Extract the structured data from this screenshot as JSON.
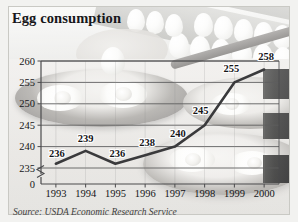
{
  "chart_data": {
    "type": "line",
    "title": "Egg consumption",
    "subtitle": "",
    "xlabel": "",
    "ylabel": "",
    "categories": [
      "1993",
      "1994",
      "1995",
      "1996",
      "1997",
      "1998",
      "1999",
      "2000"
    ],
    "values": [
      236,
      239,
      236,
      238,
      240,
      245,
      255,
      258
    ],
    "point_labels": [
      "236",
      "239",
      "236",
      "238",
      "240",
      "245",
      "255",
      "258"
    ],
    "series": [
      {
        "name": "Egg consumption",
        "values": [
          236,
          239,
          236,
          238,
          240,
          245,
          255,
          258
        ]
      }
    ],
    "ylim": [
      235,
      260
    ],
    "yticks": [
      235,
      240,
      245,
      250,
      255,
      260
    ],
    "ytick_labels": [
      "235",
      "240",
      "245",
      "250",
      "255",
      "260"
    ],
    "axis_origin_label": "0",
    "axis_break": true,
    "grid": true,
    "legend": false,
    "legend_position": "none",
    "line_color": "#3a3a3c",
    "axis_color": "#4a4a4c",
    "grid_color": "#5d5d5f",
    "label_color": "#151518"
  },
  "figure": {
    "title": "Egg consumption",
    "source": "Source: USDA Economic Research Service",
    "background": "grayscale photograph of eggs in cartons and fried eggs in skillets",
    "frame_color": "#c9c9c4",
    "page_background": "#f2f2f0"
  }
}
